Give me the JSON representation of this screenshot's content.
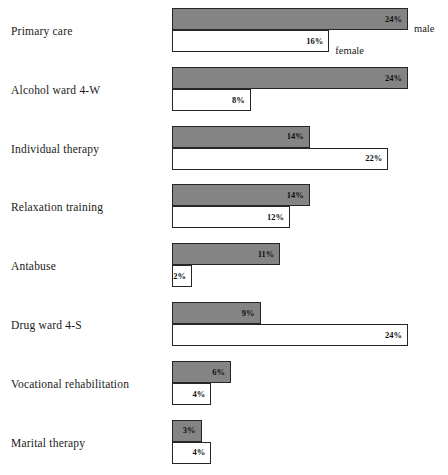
{
  "chart_data": {
    "type": "bar",
    "orientation": "horizontal",
    "title": "",
    "subtitle": "",
    "xlabel": "",
    "ylabel": "",
    "grid": false,
    "legend_position": "inline-right-first-row",
    "xlim": [
      0,
      24
    ],
    "value_suffix": "%",
    "categories": [
      "Primary care",
      "Alcohol ward 4-W",
      "Individual therapy",
      "Relaxation training",
      "Antabuse",
      "Drug ward 4-S",
      "Vocational rehabilitation",
      "Marital therapy"
    ],
    "series": [
      {
        "name": "male",
        "color": "#848484",
        "values": [
          24,
          24,
          14,
          14,
          11,
          9,
          6,
          3
        ],
        "labels": [
          "24%",
          "24%",
          "14%",
          "14%",
          "11%",
          "9%",
          "6%",
          "3%"
        ]
      },
      {
        "name": "female",
        "color": "#ffffff",
        "values": [
          16,
          8,
          22,
          12,
          2,
          24,
          4,
          4
        ],
        "labels": [
          "16%",
          "8%",
          "22%",
          "12%",
          "2%",
          "24%",
          "4%",
          "4%"
        ]
      }
    ]
  },
  "legend": {
    "male_label": "male",
    "female_label": "female"
  },
  "style": {
    "bar_fill_male": "#848484",
    "bar_fill_female": "#ffffff",
    "bar_border": "#262626",
    "background": "#ffffff",
    "text_color": "#1a1a1a"
  }
}
